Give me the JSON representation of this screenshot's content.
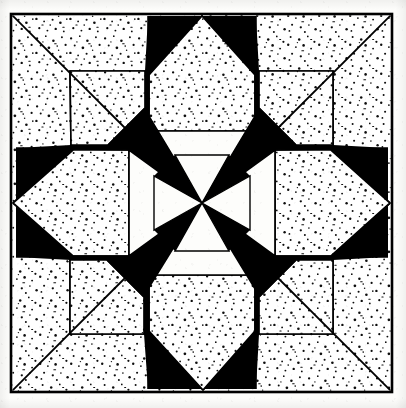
{
  "document": {
    "kind": "line-drawing",
    "title": "Eight-Pointed Star Quilt Block",
    "alt_text": "Black and white line drawing of an eight pointed star quilt block with stippled and solid black patches inside a square border",
    "caption": ""
  },
  "canvas": {
    "width": 406,
    "height": 408,
    "paper_color": "#fdfdfb",
    "ink_color": "#000000",
    "stipple_color": "#111111"
  },
  "frame": {
    "name": "outer-border",
    "left": 11,
    "top": 14,
    "right": 392,
    "bottom": 392,
    "stroke_width": 2.6,
    "stroke_color": "#000000"
  },
  "geometry": {
    "center_x": 202,
    "center_y": 203,
    "inner_radius": 52,
    "mid_radius": 104,
    "outer_radius": 189,
    "point_count": 8,
    "line_stroke_width": 1.7
  },
  "palette": {
    "black": "#000000",
    "white": "#ffffff",
    "paper": "#fdfdfb",
    "stipple": "#101010"
  },
  "legend": {
    "black_patch_label": "solid black patch",
    "stippled_patch_label": "stippled patch",
    "plain_patch_label": "plain white patch"
  },
  "chart_data": {
    "type": "diagram",
    "symmetry_order": 8,
    "patch_counts": {
      "center_diamonds_black": 4,
      "center_diamonds_white": 4,
      "radiating_black_parallelograms": 8,
      "stippled_pentagons": 8,
      "corner_stippled_triangles": 4
    },
    "fills": [
      "black",
      "white",
      "stipple"
    ]
  },
  "shapes": {
    "center_wedges": [
      {
        "name": "center-wedge-n",
        "fill": "white",
        "angle_deg": 270
      },
      {
        "name": "center-wedge-ne",
        "fill": "black",
        "angle_deg": 315
      },
      {
        "name": "center-wedge-e",
        "fill": "white",
        "angle_deg": 0
      },
      {
        "name": "center-wedge-se",
        "fill": "black",
        "angle_deg": 45
      },
      {
        "name": "center-wedge-s",
        "fill": "white",
        "angle_deg": 90
      },
      {
        "name": "center-wedge-sw",
        "fill": "black",
        "angle_deg": 135
      },
      {
        "name": "center-wedge-w",
        "fill": "white",
        "angle_deg": 180
      },
      {
        "name": "center-wedge-nw",
        "fill": "black",
        "angle_deg": 225
      }
    ],
    "radiating_arms": [
      {
        "name": "arm-n",
        "fill": "stipple",
        "angle_deg": 270
      },
      {
        "name": "arm-ne",
        "fill": "black",
        "angle_deg": 315
      },
      {
        "name": "arm-e",
        "fill": "stipple",
        "angle_deg": 0
      },
      {
        "name": "arm-se",
        "fill": "black",
        "angle_deg": 45
      },
      {
        "name": "arm-s",
        "fill": "stipple",
        "angle_deg": 90
      },
      {
        "name": "arm-sw",
        "fill": "black",
        "angle_deg": 135
      },
      {
        "name": "arm-w",
        "fill": "stipple",
        "angle_deg": 180
      },
      {
        "name": "arm-nw",
        "fill": "black",
        "angle_deg": 225
      }
    ],
    "corner_triangles": [
      {
        "name": "corner-triangle-nw",
        "fill": "stipple"
      },
      {
        "name": "corner-triangle-ne",
        "fill": "stipple"
      },
      {
        "name": "corner-triangle-se",
        "fill": "stipple"
      },
      {
        "name": "corner-triangle-sw",
        "fill": "stipple"
      }
    ]
  }
}
